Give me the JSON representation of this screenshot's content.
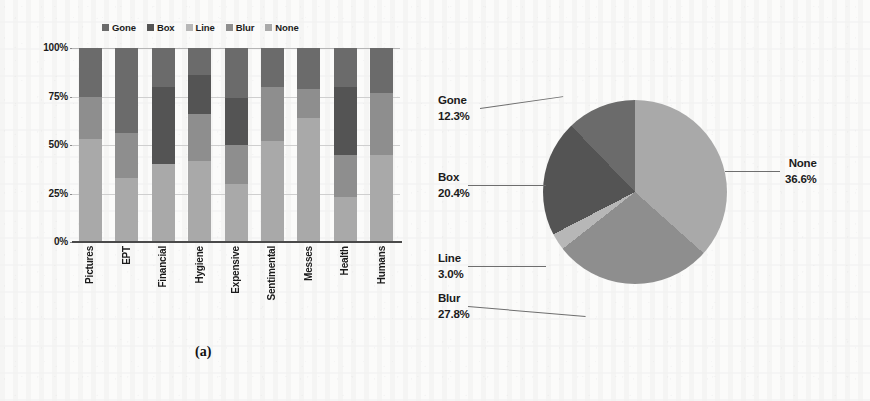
{
  "figure": {
    "caption_a": "(a)",
    "caption_b": "(b)"
  },
  "colors": {
    "gone": "#6b6b6b",
    "box": "#545454",
    "line": "#b7b7b7",
    "blur": "#8e8e8e",
    "none": "#a9a9a9",
    "axis": "#4a4a4a",
    "grid": "#cfcfcf",
    "text": "#1b1b1b",
    "background": "#fbfbfa"
  },
  "chart_data": [
    {
      "type": "bar",
      "subfigure": "a",
      "title": "",
      "xlabel": "",
      "ylabel": "",
      "stacked": true,
      "normalized": true,
      "grid": true,
      "legend_position": "top",
      "ylim": [
        0,
        100
      ],
      "yticks": [
        "0%",
        "25%",
        "50%",
        "75%",
        "100%"
      ],
      "ytick_values": [
        0,
        25,
        50,
        75,
        100
      ],
      "categories": [
        "Pictures",
        "EPT",
        "Financial",
        "Hygiene",
        "Expensive",
        "Sentimental",
        "Messes",
        "Health",
        "Humans"
      ],
      "series": [
        {
          "name": "None",
          "color": "#a9a9a9",
          "values": [
            53,
            33,
            40,
            42,
            30,
            52,
            64,
            23,
            45
          ]
        },
        {
          "name": "Blur",
          "color": "#8e8e8e",
          "values": [
            22,
            23,
            0,
            24,
            20,
            28,
            15,
            22,
            32
          ]
        },
        {
          "name": "Line",
          "color": "#b7b7b7",
          "values": [
            0,
            0,
            0,
            0,
            0,
            0,
            0,
            0,
            0
          ]
        },
        {
          "name": "Box",
          "color": "#545454",
          "values": [
            0,
            0,
            40,
            20,
            24,
            0,
            0,
            35,
            0
          ]
        },
        {
          "name": "Gone",
          "color": "#6b6b6b",
          "values": [
            25,
            44,
            20,
            14,
            26,
            20,
            21,
            20,
            23
          ]
        }
      ],
      "legend": [
        {
          "label": "Gone",
          "color": "#6b6b6b"
        },
        {
          "label": "Box",
          "color": "#545454"
        },
        {
          "label": "Line",
          "color": "#b7b7b7"
        },
        {
          "label": "Blur",
          "color": "#8e8e8e"
        },
        {
          "label": "None",
          "color": "#a9a9a9"
        }
      ]
    },
    {
      "type": "pie",
      "subfigure": "b",
      "title": "",
      "legend_position": "callouts",
      "slices": [
        {
          "label": "None",
          "percent": 36.6,
          "percent_text": "36.6%",
          "color": "#a9a9a9"
        },
        {
          "label": "Blur",
          "percent": 27.8,
          "percent_text": "27.8%",
          "color": "#8e8e8e"
        },
        {
          "label": "Line",
          "percent": 3.0,
          "percent_text": "3.0%",
          "color": "#b7b7b7"
        },
        {
          "label": "Box",
          "percent": 20.4,
          "percent_text": "20.4%",
          "color": "#545454"
        },
        {
          "label": "Gone",
          "percent": 12.3,
          "percent_text": "12.3%",
          "color": "#6b6b6b"
        }
      ]
    }
  ]
}
